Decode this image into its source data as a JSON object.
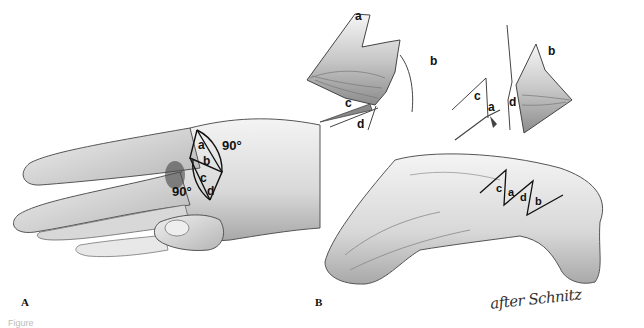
{
  "figure": {
    "panels": [
      {
        "id": "A",
        "label": "A",
        "description": "Hand with Z-plasty flaps drawn on first web space",
        "flap_labels": [
          "a",
          "b",
          "c",
          "d"
        ],
        "angles": [
          "90°",
          "90°"
        ]
      },
      {
        "id": "B",
        "label": "B",
        "description": "Transposed flaps and sutured result",
        "upper_left_flap_labels": [
          "a",
          "b",
          "c",
          "d"
        ],
        "upper_right_flap_labels": [
          "c",
          "a",
          "d",
          "b"
        ],
        "sutured_order_labels": [
          "c",
          "a",
          "d",
          "b"
        ]
      }
    ],
    "signature": "after Schnitz",
    "caption_partial": "Figure"
  },
  "colors": {
    "ink": "#222222",
    "skin_light": "#f2f2f2",
    "skin_mid": "#cfcfcf",
    "skin_shadow": "#9a9a9a",
    "background": "#ffffff"
  }
}
